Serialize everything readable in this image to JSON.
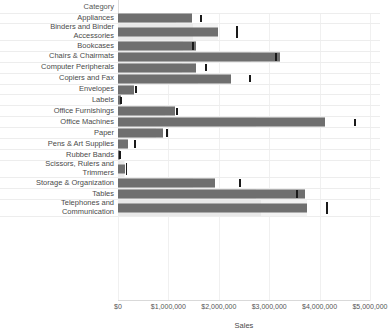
{
  "axis": {
    "category_header": "Category",
    "x_title": "Sales",
    "x_ticks": [
      "$0",
      "$1,000,000",
      "$2,000,000",
      "$3,000,000",
      "$4,000,000",
      "$5,000,000"
    ],
    "x_tick_values": [
      0,
      1000000,
      2000000,
      3000000,
      4000000,
      5000000
    ]
  },
  "colors": {
    "bar": "#6f6f6f",
    "band": "#e9e9e9",
    "band_light": "#f3f3f3",
    "reference_line": "#1a1a1a",
    "gridline": "#f0f0f0",
    "text": "#4a4a4a"
  },
  "chart_data": {
    "type": "bar",
    "title": "",
    "subtitle": "",
    "xlabel": "Sales",
    "ylabel": "Category",
    "xlim": [
      0,
      5000000
    ],
    "grid": true,
    "legend": "none",
    "orientation": "horizontal",
    "annotations": "Each row shows a dark Sales bar, a lighter reference band, and a black reference-line marker.",
    "categories": [
      "Appliances",
      "Binders and Binder\nAccessories",
      "Bookcases",
      "Chairs & Chairmats",
      "Computer Peripherals",
      "Copiers and Fax",
      "Envelopes",
      "Labels",
      "Office Furnishings",
      "Office Machines",
      "Paper",
      "Pens & Art Supplies",
      "Rubber Bands",
      "Scissors, Rulers and\nTrimmers",
      "Storage & Organization",
      "Tables",
      "Telephones and\nCommunication"
    ],
    "series": [
      {
        "name": "Sales",
        "values": [
          1470000,
          1980000,
          1550000,
          3215000,
          1550000,
          2240000,
          320000,
          60000,
          1130000,
          4110000,
          890000,
          200000,
          30000,
          130000,
          1925000,
          3710000,
          3750000
        ]
      },
      {
        "name": "Reference band",
        "values": [
          1160000,
          1490000,
          1280000,
          2640000,
          1270000,
          1580000,
          290000,
          50000,
          940000,
          2740000,
          760000,
          175000,
          28000,
          115000,
          1490000,
          2740000,
          2830000
        ]
      },
      {
        "name": "Reference line",
        "values": [
          1650000,
          2360000,
          1490000,
          3135000,
          1745000,
          2620000,
          355000,
          60000,
          1170000,
          4700000,
          975000,
          335000,
          35000,
          165000,
          2420000,
          3550000,
          4150000
        ]
      }
    ]
  }
}
